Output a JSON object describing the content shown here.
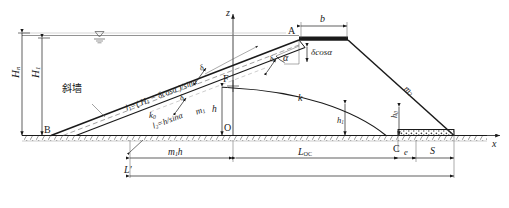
{
  "figure": {
    "kind": "engineering-cross-section",
    "background_color": "#ffffff",
    "line_color": "#1a1a1a"
  },
  "axes": {
    "z_axis_label": "z",
    "x_axis_label": "x",
    "origin_label": "O"
  },
  "points": {
    "a": "A",
    "b": "B",
    "c": "C",
    "f": "F",
    "o": "O"
  },
  "annotations": {
    "inclined_wall_cjk": "斜墙",
    "crest_width": "b",
    "core_thickness": "δcosα",
    "core_angle": "α",
    "upstream_head_total": "H",
    "upstream_head_total_sub": "n",
    "upstream_head": "H",
    "upstream_head_sub": "1",
    "seepage_line_1": "l",
    "seepage_line_1_sub": "1",
    "seepage_line_1_expr": "=( H",
    "seepage_line_1_expr_sub": "1",
    "seepage_line_1_expr_tail": " − δcosα )/sinα",
    "seepage_line_2": "l",
    "seepage_line_2_sub": "2",
    "seepage_line_2_expr": "=h/sinα",
    "perm_core": "k",
    "perm_core_sub": "0",
    "perm_body": "k",
    "slope_upstream": "m",
    "slope_upstream_sub": "1",
    "slope_downstream": "m",
    "slope_downstream_sub": "2",
    "depth_h": "h",
    "depth_h1": "h",
    "depth_h1_sub": "1",
    "tail_depth": "h",
    "tail_depth_sub": "0",
    "delta_small": "δ",
    "drain_width": "S",
    "toe_offset": "e",
    "base_upstream": "m",
    "base_upstream_sub": "1",
    "base_upstream_tail": "h",
    "length_oc": "L",
    "length_oc_sub": "OC",
    "length_total": "L′",
    "water_table_symbol": "▽"
  }
}
